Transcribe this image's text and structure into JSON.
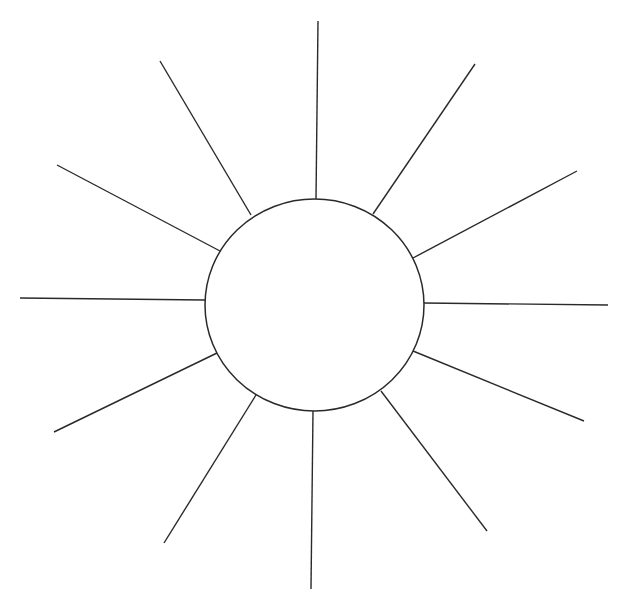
{
  "diagram": {
    "type": "spider-map",
    "colors": {
      "background": "#ffffff",
      "stroke": "#2a2a2a"
    },
    "center": {
      "cx": 314.5,
      "cy": 305,
      "rx": 109.5,
      "ry": 106,
      "label": ""
    },
    "rays": [
      {
        "id": "top",
        "x1": 316,
        "y1": 199,
        "x2": 318,
        "y2": 21,
        "label": ""
      },
      {
        "id": "upper-right",
        "x1": 373,
        "y1": 214,
        "x2": 475,
        "y2": 64,
        "label": ""
      },
      {
        "id": "right-upper",
        "x1": 413,
        "y1": 258,
        "x2": 577,
        "y2": 171,
        "label": ""
      },
      {
        "id": "right",
        "x1": 424,
        "y1": 303,
        "x2": 608,
        "y2": 305,
        "label": ""
      },
      {
        "id": "right-lower",
        "x1": 413,
        "y1": 351,
        "x2": 584,
        "y2": 421,
        "label": ""
      },
      {
        "id": "lower-right",
        "x1": 381,
        "y1": 391,
        "x2": 487,
        "y2": 531,
        "label": ""
      },
      {
        "id": "bottom",
        "x1": 313,
        "y1": 411,
        "x2": 311,
        "y2": 589,
        "label": ""
      },
      {
        "id": "lower-left",
        "x1": 256,
        "y1": 395,
        "x2": 164,
        "y2": 543,
        "label": ""
      },
      {
        "id": "left-lower",
        "x1": 217,
        "y1": 353,
        "x2": 54,
        "y2": 432,
        "label": ""
      },
      {
        "id": "left",
        "x1": 205,
        "y1": 300,
        "x2": 20,
        "y2": 298,
        "label": ""
      },
      {
        "id": "left-upper",
        "x1": 220,
        "y1": 251,
        "x2": 57,
        "y2": 165,
        "label": ""
      },
      {
        "id": "upper-left",
        "x1": 251,
        "y1": 215,
        "x2": 160,
        "y2": 61,
        "label": ""
      }
    ]
  }
}
